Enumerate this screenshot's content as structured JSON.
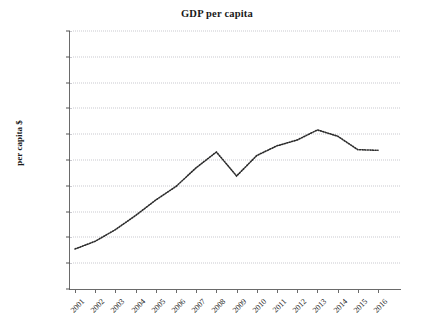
{
  "chart_data": {
    "type": "line",
    "title": "GDP per capita",
    "xlabel": "",
    "ylabel": "per capita $",
    "categories": [
      "2001",
      "2002",
      "2003",
      "2004",
      "2005",
      "2006",
      "2007",
      "2008",
      "2009",
      "2010",
      "2011",
      "2012",
      "2013",
      "2014",
      "2015",
      "2016"
    ],
    "values": [
      3100,
      3700,
      4600,
      5700,
      6900,
      7950,
      9400,
      10620,
      8760,
      10350,
      11100,
      11550,
      12330,
      11850,
      10800,
      10750
    ],
    "series": [
      {
        "name": "GDP per capita",
        "values": [
          3100,
          3700,
          4600,
          5700,
          6900,
          7950,
          9400,
          10620,
          8760,
          10350,
          11100,
          11550,
          12330,
          11850,
          10800,
          10750
        ]
      }
    ],
    "ylim": [
      0,
      20000
    ],
    "ytick_values": [
      0,
      2000,
      4000,
      6000,
      8000,
      10000,
      12000,
      14000,
      16000,
      18000,
      20000
    ],
    "ytick_labels": [
      "0",
      "2 000",
      "4 000",
      "6 000",
      "8 000",
      "10 000",
      "12 000",
      "14 000",
      "16 000",
      "18 000",
      "20 000"
    ],
    "xtick_labels": [
      "2001",
      "2002",
      "2003",
      "2004",
      "2005",
      "2006",
      "2007",
      "2008",
      "2009",
      "2010",
      "2011",
      "2012",
      "2013",
      "2014",
      "2015",
      "2016"
    ],
    "grid": true,
    "grid_axis": "y",
    "grid_style": "dotted",
    "legend": false,
    "legend_position": "none",
    "line_style": "dotted",
    "line_color": "#2b2b2b",
    "marker": "none",
    "background_color": "#ffffff",
    "axis_color": "#6a6a6a",
    "grid_color": "#c9c9cf",
    "xtick_rotation": -45
  }
}
